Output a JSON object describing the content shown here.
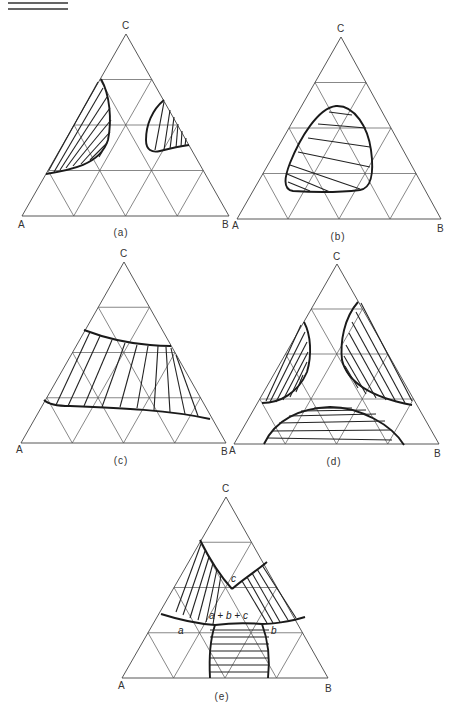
{
  "figure": {
    "panels": [
      {
        "id": "a",
        "caption": "(a)",
        "vertices": {
          "left": "A",
          "right": "B",
          "top": "C"
        },
        "regions": [
          "two-phase region near A-C edge",
          "two-phase region near B-C edge"
        ]
      },
      {
        "id": "b",
        "caption": "(b)",
        "vertices": {
          "left": "A",
          "right": "B",
          "top": "C"
        },
        "regions": [
          "closed two-phase region in interior"
        ]
      },
      {
        "id": "c",
        "caption": "(c)",
        "vertices": {
          "left": "A",
          "right": "B",
          "top": "C"
        },
        "regions": [
          "two-phase band spanning A-C to B-C"
        ]
      },
      {
        "id": "d",
        "caption": "(d)",
        "vertices": {
          "left": "A",
          "right": "B",
          "top": "C"
        },
        "regions": [
          "two-phase region near A-C edge",
          "two-phase region near B-C edge",
          "two-phase region near A-B edge"
        ]
      },
      {
        "id": "e",
        "caption": "(e)",
        "vertices": {
          "left": "A",
          "right": "B",
          "top": "C"
        },
        "regions": [
          "three two-phase regions meeting in a three-phase triangle"
        ],
        "labels": {
          "phase_a": "a",
          "phase_b": "b",
          "phase_c": "c",
          "three_phase": "a + b + c"
        }
      }
    ]
  }
}
